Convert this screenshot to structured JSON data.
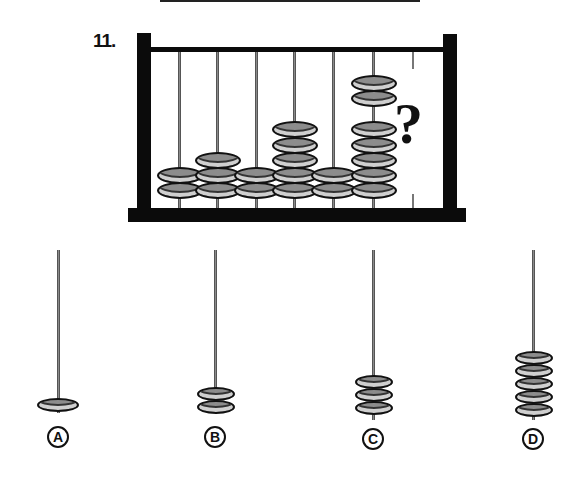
{
  "question": {
    "number_label": "11.",
    "unknown_symbol": "?",
    "abacus": {
      "rods": [
        {
          "index": 1,
          "beads": 2
        },
        {
          "index": 2,
          "beads": 3
        },
        {
          "index": 3,
          "beads": 2
        },
        {
          "index": 4,
          "beads": 5
        },
        {
          "index": 5,
          "beads": 2
        },
        {
          "index": 6,
          "beads": 7,
          "grouping": "2 + 5"
        },
        {
          "index": 7,
          "beads": null,
          "label": "?"
        }
      ]
    }
  },
  "options": [
    {
      "label": "A",
      "beads": 1
    },
    {
      "label": "B",
      "beads": 2
    },
    {
      "label": "C",
      "beads": 3
    },
    {
      "label": "D",
      "beads": 5
    }
  ],
  "colors": {
    "frame": "#0b0b0b",
    "bead_fill": "#8c8c8c",
    "bead_highlight": "#cfcfcf",
    "rod": "#8a8a8a"
  }
}
